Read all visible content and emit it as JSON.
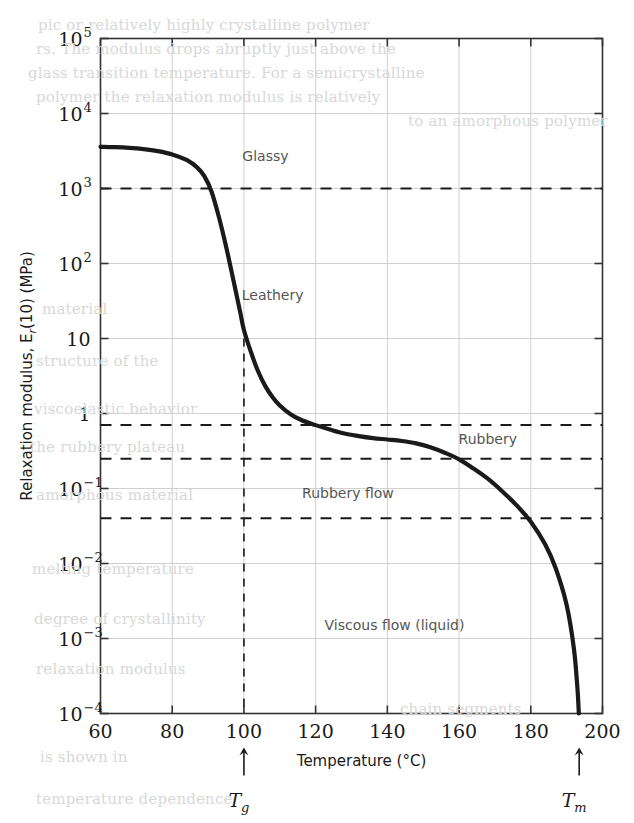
{
  "chart_data": {
    "type": "line",
    "title": "",
    "xlabel": "Temperature (°C)",
    "ylabel": "Relaxation modulus, E",
    "ylabel_sub": "r",
    "ylabel_tail": "(10) (MPa)",
    "xlim": [
      60,
      200
    ],
    "ylim": [
      0.0001,
      100000
    ],
    "yscale": "log",
    "grid": true,
    "legend": null,
    "xticks": [
      60,
      80,
      100,
      120,
      140,
      160,
      180,
      200
    ],
    "xtick_labels": [
      "60",
      "80",
      "100",
      "120",
      "140",
      "160",
      "180",
      "200"
    ],
    "yticks": [
      0.0001,
      0.001,
      0.01,
      0.1,
      1,
      10,
      100,
      1000,
      10000,
      100000
    ],
    "ytick_labels": [
      {
        "base": "10",
        "exp": "−4"
      },
      {
        "base": "10",
        "exp": "−3"
      },
      {
        "base": "10",
        "exp": "−2"
      },
      {
        "base": "10",
        "exp": "−1"
      },
      {
        "base": "1",
        "exp": ""
      },
      {
        "base": "10",
        "exp": ""
      },
      {
        "base": "10",
        "exp": "2"
      },
      {
        "base": "10",
        "exp": "3"
      },
      {
        "base": "10",
        "exp": "4"
      },
      {
        "base": "10",
        "exp": "5"
      }
    ],
    "series": [
      {
        "name": "Relaxation modulus vs temperature",
        "points": [
          [
            60,
            3600
          ],
          [
            64,
            3560
          ],
          [
            68,
            3480
          ],
          [
            72,
            3350
          ],
          [
            76,
            3150
          ],
          [
            80,
            2850
          ],
          [
            84,
            2400
          ],
          [
            87,
            1900
          ],
          [
            89,
            1450
          ],
          [
            91,
            900
          ],
          [
            93,
            420
          ],
          [
            95,
            170
          ],
          [
            97,
            62
          ],
          [
            99,
            22
          ],
          [
            100,
            13
          ],
          [
            102,
            6.5
          ],
          [
            104,
            3.6
          ],
          [
            106,
            2.3
          ],
          [
            108,
            1.65
          ],
          [
            110,
            1.28
          ],
          [
            113,
            0.98
          ],
          [
            116,
            0.82
          ],
          [
            120,
            0.7
          ],
          [
            124,
            0.61
          ],
          [
            128,
            0.54
          ],
          [
            132,
            0.5
          ],
          [
            136,
            0.47
          ],
          [
            140,
            0.45
          ],
          [
            144,
            0.43
          ],
          [
            148,
            0.4
          ],
          [
            152,
            0.355
          ],
          [
            156,
            0.3
          ],
          [
            160,
            0.245
          ],
          [
            164,
            0.185
          ],
          [
            168,
            0.135
          ],
          [
            172,
            0.092
          ],
          [
            176,
            0.06
          ],
          [
            180,
            0.036
          ],
          [
            184,
            0.018
          ],
          [
            187,
            0.0085
          ],
          [
            190,
            0.0028
          ],
          [
            192,
            0.00075
          ],
          [
            193,
            0.00022
          ],
          [
            193.4,
            0.0001
          ]
        ]
      }
    ],
    "hlines": [
      {
        "value": 1000,
        "label": "Glassy",
        "style": "dashed"
      },
      {
        "value": 0.7,
        "label": "",
        "style": "dashed"
      },
      {
        "value": 0.25,
        "label": "Rubbery",
        "style": "dashed"
      },
      {
        "value": 0.04,
        "label": "Rubbery flow",
        "style": "dashed"
      }
    ],
    "vlines": [
      {
        "value": 100,
        "label": "Tg",
        "style": "dashed",
        "top": 10
      }
    ],
    "annotations": [
      {
        "text": "Glassy",
        "x": 106,
        "y": 2300
      },
      {
        "text": "Leathery",
        "x": 108,
        "y": 33
      },
      {
        "text": "Rubbery",
        "x": 168,
        "y": 0.39
      },
      {
        "text": "Rubbery flow",
        "x": 129,
        "y": 0.075
      },
      {
        "text": "Viscous flow (liquid)",
        "x": 142,
        "y": 0.0013
      }
    ],
    "markers": [
      {
        "label": "T",
        "sub": "g",
        "x": 100,
        "name": "glass-transition-temperature"
      },
      {
        "label": "T",
        "sub": "m",
        "x": 193.5,
        "name": "melting-temperature"
      }
    ]
  },
  "background_text": [
    {
      "text": "pic or relatively highly crystalline polymer",
      "x": 38,
      "y": 16
    },
    {
      "text": "rs. The modulus drops abruptly just above the",
      "x": 36,
      "y": 40
    },
    {
      "text": "glass transition temperature. For a semicrystalline",
      "x": 28,
      "y": 64
    },
    {
      "text": "polymer the relaxation modulus is relatively",
      "x": 36,
      "y": 88
    },
    {
      "text": "to an amorphous polymer",
      "x": 408,
      "y": 112
    },
    {
      "text": "material",
      "x": 42,
      "y": 300
    },
    {
      "text": "structure of the",
      "x": 36,
      "y": 352
    },
    {
      "text": "viscoelastic behavior",
      "x": 34,
      "y": 400
    },
    {
      "text": "the rubbery plateau",
      "x": 30,
      "y": 438
    },
    {
      "text": "amorphous material",
      "x": 36,
      "y": 486
    },
    {
      "text": "melting temperature",
      "x": 32,
      "y": 560
    },
    {
      "text": "degree of crystallinity",
      "x": 34,
      "y": 610
    },
    {
      "text": "relaxation modulus",
      "x": 36,
      "y": 660
    },
    {
      "text": "chain segments",
      "x": 400,
      "y": 700
    },
    {
      "text": "is shown in",
      "x": 40,
      "y": 748
    },
    {
      "text": "temperature dependence",
      "x": 36,
      "y": 790
    }
  ],
  "colors": {
    "curve": "#1a1a1a",
    "axis": "#333333",
    "grid": "#cfcfcf",
    "dashed": "#1a1a1a",
    "region_label": "#555555",
    "background": "#ffffff"
  }
}
